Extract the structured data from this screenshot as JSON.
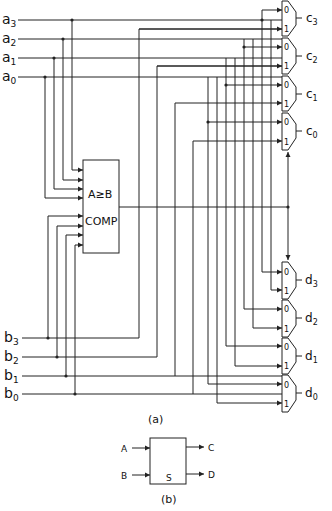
{
  "figure_a": {
    "caption": "(a)",
    "inputs_a": [
      {
        "name": "a",
        "sub": "3"
      },
      {
        "name": "a",
        "sub": "2"
      },
      {
        "name": "a",
        "sub": "1"
      },
      {
        "name": "a",
        "sub": "0"
      }
    ],
    "inputs_b": [
      {
        "name": "b",
        "sub": "3"
      },
      {
        "name": "b",
        "sub": "2"
      },
      {
        "name": "b",
        "sub": "1"
      },
      {
        "name": "b",
        "sub": "0"
      }
    ],
    "comparator": {
      "line1": "A≥B",
      "line2": "COMP"
    },
    "outputs_c": [
      {
        "name": "c",
        "sub": "3"
      },
      {
        "name": "c",
        "sub": "2"
      },
      {
        "name": "c",
        "sub": "1"
      },
      {
        "name": "c",
        "sub": "0"
      }
    ],
    "outputs_d": [
      {
        "name": "d",
        "sub": "3"
      },
      {
        "name": "d",
        "sub": "2"
      },
      {
        "name": "d",
        "sub": "1"
      },
      {
        "name": "d",
        "sub": "0"
      }
    ],
    "mux_input_labels": [
      "0",
      "1"
    ]
  },
  "figure_b": {
    "caption": "(b)",
    "input_a": "A",
    "input_b": "B",
    "output_c": "C",
    "output_d": "D",
    "block_label": "S"
  }
}
